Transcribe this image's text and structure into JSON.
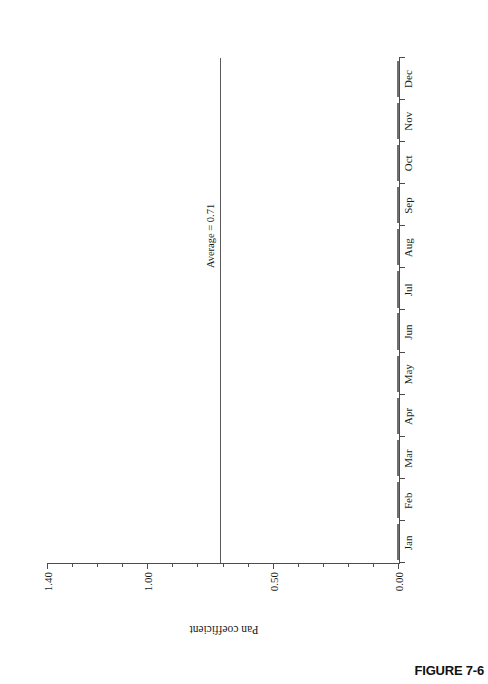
{
  "figure": {
    "caption": "FIGURE 7-6"
  },
  "chart_data": {
    "type": "bar",
    "title": "",
    "xlabel": "",
    "ylabel": "Pan coefficient",
    "categories": [
      "Jan",
      "Feb",
      "Mar",
      "Apr",
      "May",
      "Jun",
      "Jul",
      "Aug",
      "Sep",
      "Oct",
      "Nov",
      "Dec"
    ],
    "values": [
      0.75,
      0.15,
      0.52,
      0.4,
      0.5,
      0.62,
      0.65,
      0.73,
      0.95,
      0.9,
      1.32,
      1.04
    ],
    "ylim": [
      0.0,
      1.4
    ],
    "major_ticks": [
      "0.00",
      "0.50",
      "1.00",
      "1.40"
    ],
    "major_tick_values": [
      0.0,
      0.5,
      1.0,
      1.4
    ],
    "minor_tick_step": 0.1,
    "grid": false,
    "legend": null,
    "orientation": "page-rotated-90",
    "bar_fill": "#d2d3d5",
    "bar_stroke": "#6e7073",
    "annotations": [
      {
        "name": "average-line",
        "label": "Average = 0.71",
        "value": 0.71,
        "color": "#5a5a5a"
      }
    ]
  }
}
